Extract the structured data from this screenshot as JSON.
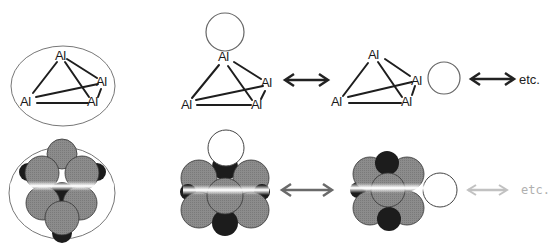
{
  "figure": {
    "type": "resonance-structures-diagram",
    "element_label": "Al",
    "continuation_label": "etc.",
    "rows": [
      {
        "name": "line-structures",
        "panels": [
          {
            "name": "reference-cluster",
            "atoms": [
              "Al",
              "Al",
              "Al",
              "Al"
            ],
            "enclosed_in_circle": true
          },
          {
            "name": "resonance-1",
            "atoms": [
              "Al",
              "Al",
              "Al",
              "Al"
            ],
            "open_circle_at": "top-atom"
          },
          {
            "name": "resonance-2",
            "atoms": [
              "Al",
              "Al",
              "Al",
              "Al"
            ],
            "open_circle_at": "right-atom"
          }
        ],
        "arrows": [
          "double-headed",
          "double-headed"
        ],
        "trailing_label": "etc."
      },
      {
        "name": "space-filling-models",
        "panels": [
          {
            "name": "reference-model",
            "enclosed_in_circle": true
          },
          {
            "name": "resonance-model-1",
            "white_sphere_at": "top"
          },
          {
            "name": "resonance-model-2",
            "white_sphere_at": "right"
          }
        ],
        "arrows": [
          "double-headed",
          "double-headed-faded"
        ],
        "trailing_label": "etc."
      }
    ]
  },
  "colors": {
    "line": "#1e1e1e",
    "sphere_gray": "#8a8a8a",
    "sphere_dark": "#1c1c1c",
    "sphere_white": "#ffffff",
    "outline": "#555555",
    "faded": "#b0b0b0"
  }
}
